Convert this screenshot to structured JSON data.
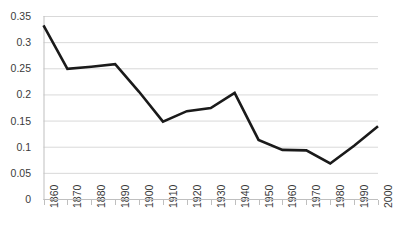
{
  "chart_data": {
    "type": "line",
    "title": "",
    "xlabel": "",
    "ylabel": "",
    "x": [
      1860,
      1870,
      1880,
      1890,
      1900,
      1910,
      1920,
      1930,
      1940,
      1950,
      1960,
      1970,
      1980,
      1990,
      2000
    ],
    "categories": [
      "1860",
      "1870",
      "1880",
      "1890",
      "1900",
      "1910",
      "1920",
      "1930",
      "1940",
      "1950",
      "1960",
      "1970",
      "1980",
      "1990",
      "2000"
    ],
    "values": [
      0.332,
      0.249,
      0.253,
      0.258,
      0.205,
      0.148,
      0.168,
      0.174,
      0.203,
      0.113,
      0.094,
      0.093,
      0.068,
      0.102,
      0.139
    ],
    "series": [
      {
        "name": "",
        "values": [
          0.332,
          0.249,
          0.253,
          0.258,
          0.205,
          0.148,
          0.168,
          0.174,
          0.203,
          0.113,
          0.094,
          0.093,
          0.068,
          0.102,
          0.139
        ]
      }
    ],
    "ylim": [
      0,
      0.35
    ],
    "xlim": [
      1860,
      2000
    ],
    "yticks": [
      0,
      0.05,
      0.1,
      0.15,
      0.2,
      0.25,
      0.3,
      0.35
    ],
    "ytick_labels": [
      "0",
      "0.05",
      "0.1",
      "0.15",
      "0.2",
      "0.25",
      "0.3",
      "0.35"
    ],
    "xticks": [
      1860,
      1870,
      1880,
      1890,
      1900,
      1910,
      1920,
      1930,
      1940,
      1950,
      1960,
      1970,
      1980,
      1990,
      2000
    ],
    "grid": "horizontal",
    "legend": "none",
    "line_color": "#1a1a1a",
    "grid_color": "#d9d9d9",
    "axis_color": "#bfbfbf",
    "text_color": "#3a3a3a",
    "background": "#ffffff",
    "markers": "none",
    "line_width": 2.6,
    "xtick_rotation": -90
  }
}
